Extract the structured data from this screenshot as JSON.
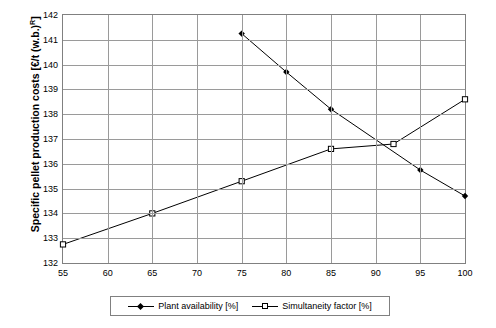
{
  "chart_data": {
    "type": "line",
    "title": "",
    "xlabel": "",
    "ylabel_plain": "Specific pellet production costs [€/t (w.b.)R]",
    "ylim": [
      132,
      142
    ],
    "xlim": [
      55,
      100
    ],
    "grid": true,
    "legend_position": "bottom",
    "y_ticks": [
      "132",
      "133",
      "134",
      "135",
      "136",
      "137",
      "138",
      "139",
      "140",
      "141",
      "142"
    ],
    "x_ticks": [
      "55",
      "60",
      "65",
      "70",
      "75",
      "80",
      "85",
      "90",
      "95",
      "100"
    ],
    "series": [
      {
        "name": "Plant availability [%]",
        "marker": "filled-diamond",
        "x": [
          75,
          80,
          85,
          95,
          100
        ],
        "y": [
          141.25,
          139.7,
          138.2,
          135.75,
          134.7
        ]
      },
      {
        "name": "Simultaneity factor [%]",
        "marker": "open-square",
        "x": [
          55,
          65,
          75,
          85,
          92,
          100
        ],
        "y": [
          132.75,
          134.0,
          135.3,
          136.6,
          136.8,
          138.6
        ]
      }
    ]
  },
  "axis": {
    "y_title_main": "Specific pellet production costs [€/t (w.b.)",
    "y_title_sub": "R",
    "y_title_end": "]"
  },
  "legend": {
    "items": [
      {
        "label": "Plant availability [%]",
        "marker": "filled-diamond"
      },
      {
        "label": "Simultaneity factor [%]",
        "marker": "open-square"
      }
    ]
  },
  "colors": {
    "line": "#000000",
    "grid": "#9a9a9a",
    "frame": "#808080",
    "background": "#ffffff"
  }
}
